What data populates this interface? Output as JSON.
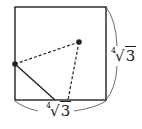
{
  "diagram": {
    "shape": "square",
    "bottom_label": {
      "index": "4",
      "radicand": "3"
    },
    "right_label": {
      "index": "4",
      "radicand": "3"
    },
    "points": [
      {
        "name": "point-left-side",
        "x": 15,
        "y": 64
      },
      {
        "name": "point-interior",
        "x": 79,
        "y": 42
      }
    ],
    "colors": {
      "stroke": "#222222"
    }
  }
}
